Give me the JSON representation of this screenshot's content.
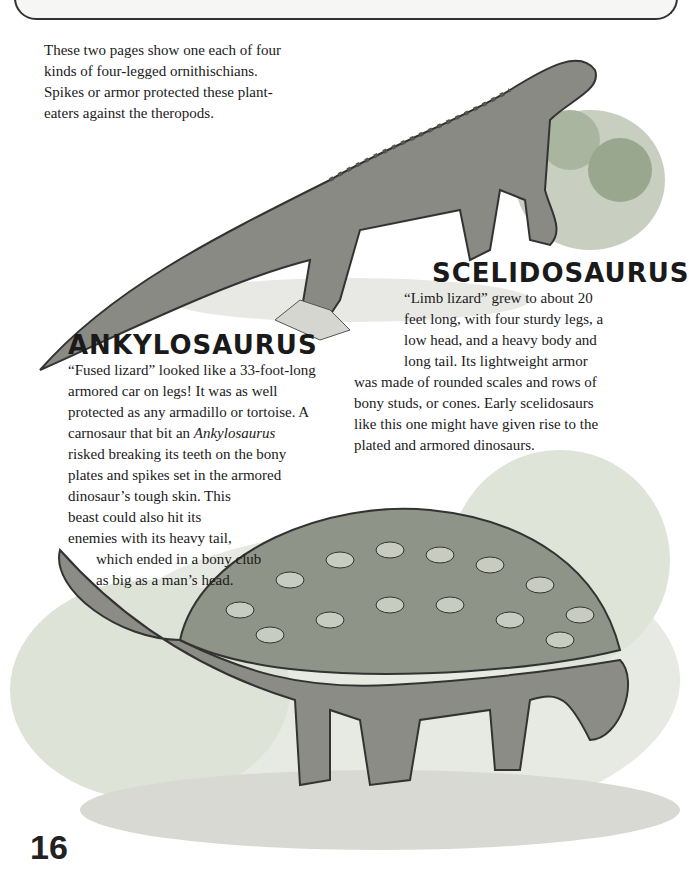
{
  "intro": {
    "lines": [
      "These two pages show one each of four",
      "kinds of four-legged ornithischians.",
      "Spikes or armor protected these plant-",
      "eaters against the theropods."
    ]
  },
  "scelidosaurus": {
    "heading": "SCELIDOSAURUS",
    "lines": [
      "“Limb lizard” grew to about 20",
      "feet long, with four sturdy legs, a",
      "low head, and a heavy body and",
      "long tail. Its lightweight armor",
      "was made of rounded scales and rows of",
      "bony studs, or cones. Early scelidosaurs",
      "like this one might have given rise to the",
      "plated and armored dinosaurs."
    ],
    "illustration": "scelidosaurus-illustration"
  },
  "ankylosaurus": {
    "heading": "ANKYLOSAURUS",
    "lines": [
      "“Fused lizard” looked like a 33-foot-long",
      "armored car on legs! It was as well",
      "protected as any armadillo or tortoise. A",
      "carnosaur that bit an",
      "risked breaking its teeth on the bony",
      "plates and spikes set in the armored",
      "dinosaur’s tough skin. This",
      "beast could also hit its",
      "enemies with its heavy tail,",
      "which ended in a bony club",
      "as big as a man’s head."
    ],
    "italic_name": "Ankylosaurus",
    "illustration": "ankylosaurus-illustration"
  },
  "page_number": "16"
}
